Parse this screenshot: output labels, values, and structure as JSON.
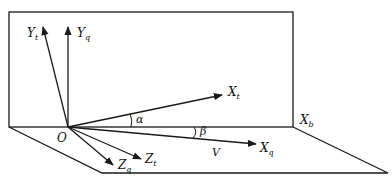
{
  "diagram": {
    "type": "coordinate-frames",
    "colors": {
      "line": "#1a1a1a",
      "background": "#ffffff"
    },
    "origin": {
      "label": "O"
    },
    "axes": [
      {
        "id": "Yt",
        "base": "Y",
        "sub": "t"
      },
      {
        "id": "Yq",
        "base": "Y",
        "sub": "q"
      },
      {
        "id": "Xt",
        "base": "X",
        "sub": "t"
      },
      {
        "id": "Xq",
        "base": "X",
        "sub": "q"
      },
      {
        "id": "Zq",
        "base": "Z",
        "sub": "q"
      },
      {
        "id": "Zt",
        "base": "Z",
        "sub": "t"
      },
      {
        "id": "Xb",
        "base": "X",
        "sub": "b"
      }
    ],
    "angles": [
      {
        "id": "alpha",
        "label": "α"
      },
      {
        "id": "beta",
        "label": "β"
      }
    ],
    "velocity": {
      "label": "V"
    }
  }
}
